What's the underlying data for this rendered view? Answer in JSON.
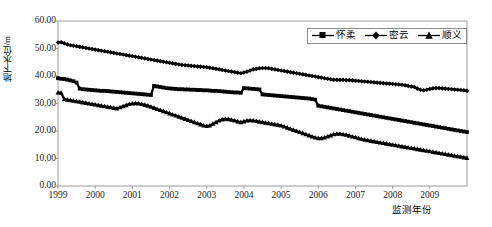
{
  "chart_data": {
    "type": "line",
    "title": "",
    "xlabel": "监测年份",
    "ylabel": "地下水位/m",
    "xlim": [
      1999,
      2010
    ],
    "ylim": [
      0,
      60
    ],
    "ytick_labels": [
      "60.00",
      "50.00",
      "40.00",
      "30.00",
      "20.00",
      "10.00",
      "0.00"
    ],
    "ytick_values": [
      60,
      50,
      40,
      30,
      20,
      10,
      0
    ],
    "xtick_labels": [
      "1999",
      "2000",
      "2001",
      "2002",
      "2003",
      "2004",
      "2005",
      "2006",
      "2007",
      "2008",
      "2009"
    ],
    "xtick_values": [
      1999,
      2000,
      2001,
      2002,
      2003,
      2004,
      2005,
      2006,
      2007,
      2008,
      2009
    ],
    "grid": false,
    "legend_position": "top-right",
    "x_step_years": 0.0833333,
    "series": [
      {
        "name": "怀柔",
        "marker": "square",
        "color": "#000000",
        "x_start": 1999.0,
        "values": [
          39.2,
          39.0,
          38.9,
          38.7,
          38.4,
          38.1,
          37.6,
          35.4,
          35.2,
          35.1,
          35.0,
          34.9,
          34.8,
          34.7,
          34.6,
          34.6,
          34.5,
          34.4,
          34.3,
          34.2,
          34.1,
          34.0,
          33.9,
          33.8,
          33.7,
          33.6,
          33.5,
          33.4,
          33.3,
          33.2,
          33.1,
          36.4,
          36.2,
          36.0,
          35.8,
          35.6,
          35.5,
          35.4,
          35.3,
          35.2,
          35.2,
          35.1,
          35.1,
          35.0,
          35.0,
          34.9,
          34.9,
          34.8,
          34.8,
          34.7,
          34.6,
          34.6,
          34.5,
          34.4,
          34.3,
          34.2,
          34.1,
          34.0,
          34.0,
          33.9,
          35.6,
          35.5,
          35.4,
          35.3,
          35.2,
          35.1,
          33.3,
          33.2,
          33.1,
          33.0,
          32.9,
          32.8,
          32.7,
          32.6,
          32.5,
          32.4,
          32.3,
          32.2,
          32.1,
          32.0,
          31.9,
          31.8,
          31.6,
          31.4,
          29.2,
          29.0,
          28.8,
          28.6,
          28.4,
          28.2,
          28.0,
          27.8,
          27.6,
          27.4,
          27.2,
          27.0,
          26.8,
          26.6,
          26.4,
          26.2,
          26.0,
          25.8,
          25.6,
          25.4,
          25.2,
          25.0,
          24.8,
          24.6,
          24.4,
          24.2,
          24.0,
          23.8,
          23.6,
          23.4,
          23.2,
          23.0,
          22.8,
          22.6,
          22.4,
          22.2,
          22.0,
          21.8,
          21.6,
          21.4,
          21.2,
          21.0,
          20.8,
          20.6,
          20.4,
          20.2,
          20.0,
          19.8,
          19.6,
          19.4,
          19.2,
          19.0,
          18.8,
          18.6,
          18.4,
          18.2,
          18.0,
          17.8,
          17.6,
          17.4,
          17.2,
          17.0,
          16.8,
          16.6,
          16.4,
          16.2,
          16.0,
          15.8,
          15.6,
          15.4,
          15.2,
          15.0,
          12.8,
          12.7,
          12.6,
          12.6,
          12.5,
          12.5,
          15.2,
          15.1,
          15.0,
          14.9,
          14.8,
          14.7,
          14.6,
          14.5,
          14.4,
          14.3,
          14.2,
          14.1,
          14.0,
          14.0,
          13.9,
          13.9,
          13.9,
          13.9
        ]
      },
      {
        "name": "密云",
        "marker": "diamond",
        "color": "#000000",
        "x_start": 1999.0,
        "values": [
          52.2,
          52.3,
          51.9,
          51.5,
          51.2,
          51.0,
          50.8,
          50.6,
          50.4,
          50.2,
          50.0,
          49.8,
          49.6,
          49.4,
          49.2,
          49.0,
          48.8,
          48.6,
          48.4,
          48.2,
          48.0,
          47.8,
          47.6,
          47.4,
          47.2,
          47.0,
          46.8,
          46.6,
          46.4,
          46.2,
          46.0,
          45.8,
          45.6,
          45.4,
          45.2,
          45.0,
          44.8,
          44.6,
          44.4,
          44.2,
          44.0,
          43.9,
          43.8,
          43.7,
          43.6,
          43.5,
          43.4,
          43.3,
          43.2,
          43.0,
          42.8,
          42.6,
          42.4,
          42.2,
          42.0,
          41.8,
          41.6,
          41.4,
          41.2,
          41.0,
          41.3,
          41.6,
          42.0,
          42.4,
          42.6,
          42.8,
          42.9,
          42.9,
          42.8,
          42.6,
          42.4,
          42.2,
          42.0,
          41.8,
          41.6,
          41.4,
          41.2,
          41.0,
          40.8,
          40.6,
          40.4,
          40.2,
          40.0,
          39.8,
          39.6,
          39.4,
          39.2,
          39.0,
          38.8,
          38.6,
          38.6,
          38.6,
          38.6,
          38.5,
          38.5,
          38.4,
          38.3,
          38.2,
          38.1,
          38.0,
          37.9,
          37.8,
          37.7,
          37.6,
          37.5,
          37.4,
          37.3,
          37.2,
          37.1,
          37.0,
          36.9,
          36.8,
          36.6,
          36.4,
          36.2,
          36.0,
          35.4,
          35.0,
          34.8,
          35.0,
          35.3,
          35.5,
          35.6,
          35.6,
          35.5,
          35.4,
          35.3,
          35.2,
          35.1,
          35.0,
          34.9,
          34.8,
          34.6,
          34.4,
          34.2,
          34.0,
          33.8,
          33.6,
          33.5,
          33.5,
          33.6,
          33.8,
          34.0,
          34.2,
          34.3,
          34.4,
          34.4,
          34.4,
          34.3,
          34.2,
          34.1,
          34.0,
          33.9,
          33.8,
          33.8,
          33.7,
          33.6,
          33.5,
          33.5,
          33.5,
          33.5,
          33.5,
          33.4,
          33.4,
          33.4,
          33.4,
          33.4,
          33.4,
          33.4,
          33.4,
          33.4,
          33.4,
          33.4,
          33.4,
          33.4,
          33.4,
          33.4,
          33.4,
          33.4,
          33.4
        ]
      },
      {
        "name": "顺义",
        "marker": "triangle",
        "color": "#000000",
        "x_start": 1999.0,
        "values": [
          34.0,
          33.9,
          31.6,
          31.4,
          31.2,
          31.0,
          30.8,
          30.6,
          30.4,
          30.2,
          30.0,
          29.8,
          29.6,
          29.4,
          29.2,
          29.0,
          28.8,
          28.6,
          28.4,
          28.2,
          28.6,
          29.0,
          29.4,
          29.8,
          30.0,
          30.1,
          30.0,
          29.8,
          29.5,
          29.2,
          28.8,
          28.4,
          28.0,
          27.6,
          27.2,
          26.8,
          26.4,
          26.0,
          25.6,
          25.2,
          24.8,
          24.4,
          24.0,
          23.6,
          23.2,
          22.8,
          22.4,
          22.0,
          21.8,
          22.0,
          22.6,
          23.2,
          23.8,
          24.2,
          24.4,
          24.3,
          24.1,
          23.8,
          23.5,
          23.2,
          23.5,
          23.8,
          23.9,
          23.8,
          23.6,
          23.4,
          23.2,
          23.0,
          22.8,
          22.6,
          22.4,
          22.2,
          22.0,
          21.6,
          21.2,
          20.8,
          20.4,
          20.0,
          19.6,
          19.2,
          18.8,
          18.4,
          18.0,
          17.6,
          17.4,
          17.4,
          17.6,
          18.0,
          18.4,
          18.8,
          19.0,
          19.0,
          18.8,
          18.6,
          18.3,
          18.0,
          17.7,
          17.4,
          17.1,
          16.8,
          16.6,
          16.4,
          16.2,
          16.0,
          15.8,
          15.6,
          15.4,
          15.2,
          15.0,
          14.8,
          14.6,
          14.4,
          14.2,
          14.0,
          13.8,
          13.6,
          13.4,
          13.2,
          13.0,
          12.8,
          12.6,
          12.4,
          12.2,
          12.0,
          11.8,
          11.6,
          11.4,
          11.2,
          11.0,
          10.8,
          10.6,
          10.4,
          10.2,
          10.0,
          9.8,
          9.6,
          9.4,
          9.2,
          9.0,
          8.8,
          8.6,
          8.4,
          8.2,
          8.0,
          7.8,
          7.6,
          7.5,
          7.6,
          7.8,
          8.0,
          8.1,
          8.0,
          7.8,
          7.6,
          7.4,
          7.2,
          7.0,
          6.8,
          6.6,
          6.4,
          6.2,
          6.0,
          5.2,
          5.0,
          4.9,
          4.9,
          4.9,
          4.9,
          4.9,
          4.9,
          4.9,
          4.9,
          4.9,
          4.9,
          4.9,
          4.9,
          4.9,
          4.9,
          4.9,
          4.9
        ]
      }
    ]
  },
  "legend": {
    "items": [
      {
        "label": "怀柔",
        "marker": "square"
      },
      {
        "label": "密云",
        "marker": "diamond"
      },
      {
        "label": "顺义",
        "marker": "triangle"
      }
    ]
  },
  "axes": {
    "y_title": "地下水位/m",
    "x_title": "监测年份"
  }
}
